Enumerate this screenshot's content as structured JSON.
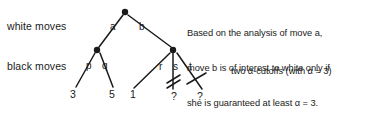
{
  "figure": {
    "background_color": "#ffffff",
    "ink_color": "#1a1a1a"
  },
  "row_labels": {
    "white": "white moves",
    "black": "black moves"
  },
  "note": {
    "line1": "Based on the analysis of move a,",
    "line2": "move b is of interest to white only if",
    "line3": "she is guaranteed at least α = 3."
  },
  "cutoff_caption": "two α-cutoffs (with α = 3)",
  "tree": {
    "root": {
      "id": "root",
      "shape": "filled-dot",
      "x": 125,
      "y": 12
    },
    "internal_nodes": [
      {
        "id": "node-a",
        "shape": "filled-dot",
        "x": 97,
        "y": 50
      },
      {
        "id": "node-b",
        "shape": "filled-dot",
        "x": 173,
        "y": 50
      }
    ],
    "edge_labels": [
      {
        "id": "a",
        "text": "a",
        "x": 110,
        "y": 22
      },
      {
        "id": "b",
        "text": "b",
        "x": 139,
        "y": 22
      },
      {
        "id": "p",
        "text": "p",
        "x": 86,
        "y": 61
      },
      {
        "id": "q",
        "text": "q",
        "x": 102,
        "y": 61
      },
      {
        "id": "r",
        "text": "r",
        "x": 159,
        "y": 62
      },
      {
        "id": "s",
        "text": "s",
        "x": 173,
        "y": 62
      },
      {
        "id": "t",
        "text": "t",
        "x": 189,
        "y": 62
      }
    ],
    "leaves": [
      {
        "id": "leaf-p",
        "text": "3",
        "x": 74,
        "y": 93
      },
      {
        "id": "leaf-q",
        "text": "5",
        "x": 112,
        "y": 93
      },
      {
        "id": "leaf-r",
        "text": "1",
        "x": 133,
        "y": 93
      },
      {
        "id": "leaf-s",
        "text": "?",
        "x": 173,
        "y": 95
      },
      {
        "id": "leaf-t",
        "text": "?",
        "x": 199,
        "y": 95
      }
    ],
    "cutoff_marks": [
      {
        "id": "cutoff-s",
        "edge": "s",
        "style": "double-slash",
        "x": 173,
        "y": 80
      },
      {
        "id": "cutoff-t",
        "edge": "t",
        "style": "single-slash",
        "x": 196,
        "y": 80
      }
    ]
  }
}
